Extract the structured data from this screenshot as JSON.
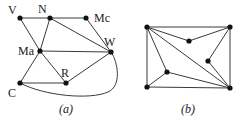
{
  "figure_a": {
    "caption": "(a)",
    "nodes": [
      {
        "id": "V",
        "label": "V",
        "x": 20,
        "y": 18
      },
      {
        "id": "N",
        "label": "N",
        "x": 50,
        "y": 18
      },
      {
        "id": "Mc",
        "label": "Mc",
        "x": 86,
        "y": 18
      },
      {
        "id": "Ma",
        "label": "Ma",
        "x": 40,
        "y": 51
      },
      {
        "id": "W",
        "label": "W",
        "x": 111,
        "y": 52
      },
      {
        "id": "R",
        "label": "R",
        "x": 66,
        "y": 83
      },
      {
        "id": "C",
        "label": "C",
        "x": 20,
        "y": 83
      }
    ],
    "edges": [
      [
        "V",
        "N"
      ],
      [
        "N",
        "Mc"
      ],
      [
        "V",
        "Ma"
      ],
      [
        "N",
        "Ma"
      ],
      [
        "N",
        "W"
      ],
      [
        "Mc",
        "W"
      ],
      [
        "Ma",
        "W"
      ],
      [
        "Ma",
        "C"
      ],
      [
        "Ma",
        "R"
      ],
      [
        "R",
        "W"
      ],
      [
        "C",
        "R"
      ],
      [
        "C",
        "W"
      ]
    ]
  },
  "figure_b": {
    "caption": "(b)",
    "nodes": [
      {
        "id": "b1",
        "x": 147,
        "y": 27
      },
      {
        "id": "b2",
        "x": 230,
        "y": 27
      },
      {
        "id": "b3",
        "x": 189,
        "y": 41
      },
      {
        "id": "b4",
        "x": 208,
        "y": 61
      },
      {
        "id": "b5",
        "x": 167,
        "y": 72
      },
      {
        "id": "b6",
        "x": 147,
        "y": 87
      },
      {
        "id": "b7",
        "x": 230,
        "y": 88
      }
    ],
    "edges": [
      [
        "b1",
        "b2"
      ],
      [
        "b1",
        "b6"
      ],
      [
        "b6",
        "b7"
      ],
      [
        "b2",
        "b7"
      ],
      [
        "b1",
        "b3"
      ],
      [
        "b3",
        "b2"
      ],
      [
        "b1",
        "b7"
      ],
      [
        "b1",
        "b5"
      ],
      [
        "b5",
        "b6"
      ],
      [
        "b5",
        "b7"
      ],
      [
        "b2",
        "b4"
      ],
      [
        "b4",
        "b7"
      ]
    ]
  }
}
